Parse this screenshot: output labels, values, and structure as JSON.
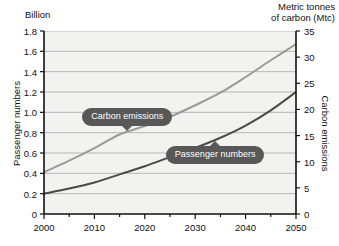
{
  "chart_data": {
    "type": "line",
    "title": "",
    "xlabel": "",
    "x": [
      2000,
      2005,
      2010,
      2015,
      2020,
      2025,
      2030,
      2035,
      2040,
      2045,
      2050
    ],
    "xlim": [
      2000,
      2050
    ],
    "xticks": [
      "2000",
      "2010",
      "2020",
      "2030",
      "2040",
      "2050"
    ],
    "grid": true,
    "legend_position": "inline-callouts",
    "axes": {
      "left": {
        "unit_label": "Billion",
        "title": "Passenger numbers",
        "ylim": [
          0,
          1.8
        ],
        "ticks": [
          "0",
          "0.2",
          "0.4",
          "0.6",
          "0.8",
          "1.0",
          "1.2",
          "1.4",
          "1.6",
          "1.8"
        ],
        "tick_values": [
          0,
          0.2,
          0.4,
          0.6,
          0.8,
          1.0,
          1.2,
          1.4,
          1.6,
          1.8
        ]
      },
      "right": {
        "unit_label": "Metric tonnes\nof carbon (Mtc)",
        "title": "Carbon emissions",
        "ylim": [
          0,
          35
        ],
        "ticks": [
          "0",
          "5",
          "10",
          "15",
          "20",
          "25",
          "30",
          "35"
        ],
        "tick_values": [
          0,
          5,
          10,
          15,
          20,
          25,
          30,
          35
        ]
      }
    },
    "series": [
      {
        "name": "Carbon emissions",
        "axis": "right",
        "color": "#9a9a9a",
        "unit": "Mtc",
        "values": [
          8.0,
          10.2,
          12.6,
          15.2,
          16.8,
          18.6,
          20.8,
          23.2,
          26.2,
          29.4,
          32.5
        ]
      },
      {
        "name": "Passenger numbers",
        "axis": "left",
        "color": "#4a4a4a",
        "unit": "Billion",
        "values": [
          0.2,
          0.25,
          0.31,
          0.39,
          0.47,
          0.56,
          0.65,
          0.75,
          0.87,
          1.02,
          1.2
        ]
      }
    ],
    "annotations": [
      {
        "label": "Carbon emissions",
        "pointer": "down",
        "x": 2016.5,
        "target_series": "Carbon emissions"
      },
      {
        "label": "Passenger numbers",
        "pointer": "up",
        "x": 2034,
        "target_series": "Passenger numbers"
      }
    ]
  }
}
